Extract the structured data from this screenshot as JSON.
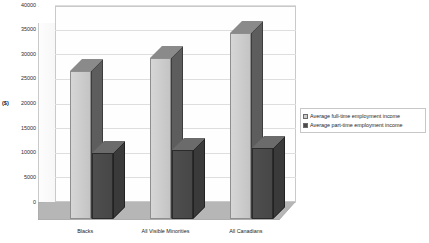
{
  "chart_data": {
    "type": "bar",
    "title": "",
    "subtitle": "",
    "xlabel": "",
    "ylabel": "($)",
    "ylim": [
      0,
      40000
    ],
    "ytick_step": 5000,
    "yticks": [
      "0",
      "5000",
      "10000",
      "15000",
      "20000",
      "25000",
      "30000",
      "35000",
      "40000"
    ],
    "ytick_values": [
      0,
      5000,
      10000,
      15000,
      20000,
      25000,
      30000,
      35000,
      40000
    ],
    "grid": true,
    "legend_position": "right",
    "style": "3d-column",
    "categories": [
      "Blacks",
      "All Visible Minorities",
      "All Canadians"
    ],
    "series": [
      {
        "name": "Average full-time employment income",
        "color": "#cccccc",
        "values": [
          30000,
          32700,
          37700
        ]
      },
      {
        "name": "Average part-time employment income",
        "color": "#4a4a4a",
        "values": [
          13400,
          14000,
          14400
        ]
      }
    ]
  },
  "legend": {
    "items": [
      {
        "label": "Average full-time employment income",
        "color": "#cccccc"
      },
      {
        "label": "Average part-time employment income",
        "color": "#4a4a4a"
      }
    ]
  },
  "axis": {
    "y_title": "($)"
  }
}
